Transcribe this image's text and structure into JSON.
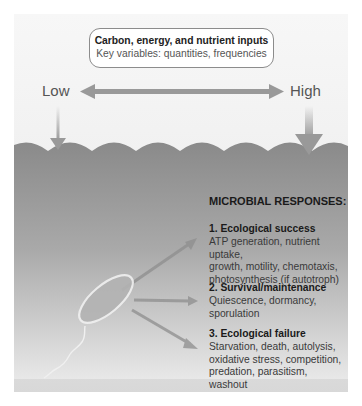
{
  "input_box": {
    "title": "Carbon, energy, and nutrient inputs",
    "subtitle": "Key variables: quantities, frequencies"
  },
  "scale": {
    "low_label": "Low",
    "high_label": "High"
  },
  "responses": {
    "title": "MICROBIAL RESPONSES:",
    "items": [
      {
        "heading": "1. Ecological success",
        "lines": [
          "ATP generation, nutrient uptake,",
          "growth, motility, chemotaxis,",
          "photosynthesis (if autotroph)"
        ]
      },
      {
        "heading": "2. Survival/maintenance",
        "lines": [
          "Quiescence, dormancy,",
          "sporulation"
        ]
      },
      {
        "heading": "3. Ecological failure",
        "lines": [
          "Starvation, death, autolysis,",
          "oxidative stress, competition,",
          "predation, parasitism, washout"
        ]
      }
    ]
  },
  "colors": {
    "arrow": "#999999",
    "water_top": "#8a8a8a",
    "water_bottom": "#e4e4e4",
    "panel": "#f2f2f2"
  }
}
